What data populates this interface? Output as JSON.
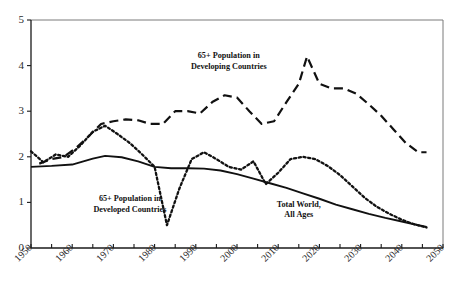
{
  "chart_data": {
    "type": "line",
    "title": "",
    "subtitle": "",
    "xlabel": "",
    "ylabel": "",
    "xlim": [
      1950,
      2050
    ],
    "ylim": [
      0,
      5
    ],
    "grid": false,
    "legend_position": "inline-annotations",
    "y_ticks": [
      "0",
      "1",
      "2",
      "3",
      "4",
      "5"
    ],
    "y_tick_values": [
      0,
      1,
      2,
      3,
      4,
      5
    ],
    "x_ticks": [
      "1950",
      "1960",
      "1970",
      "1980",
      "1990",
      "2000",
      "2010",
      "2020",
      "2030",
      "2040",
      "2050"
    ],
    "x_tick_values": [
      1950,
      1960,
      1970,
      1980,
      1990,
      2000,
      2010,
      2020,
      2030,
      2040,
      2050
    ],
    "x_minor_tick_values": [
      1955,
      1965,
      1975,
      1985,
      1995,
      2005,
      2015,
      2025,
      2035,
      2045
    ],
    "annotations": [
      {
        "name": "developing-countries-label",
        "lines": [
          "65+ Population in",
          "Developing Countries"
        ],
        "x": 1998,
        "y": 4.08
      },
      {
        "name": "developed-countries-label",
        "lines": [
          "65+ Population in",
          "Developed Countries"
        ],
        "x": 1974,
        "y": 0.95
      },
      {
        "name": "total-world-label",
        "lines": [
          "Total World,",
          "All Ages"
        ],
        "x": 2015,
        "y": 0.82
      }
    ],
    "series": [
      {
        "name": "65+ Population in Developing Countries",
        "style": "dashed",
        "color": "#111111",
        "x": [
          1952,
          1955,
          1958,
          1961,
          1964,
          1967,
          1970,
          1973,
          1976,
          1979,
          1982,
          1985,
          1988,
          1991,
          1994,
          1997,
          2000,
          2003,
          2006,
          2009,
          2012,
          2015,
          2017,
          2020,
          2023,
          2026,
          2029,
          2032,
          2035,
          2038,
          2041,
          2044,
          2046
        ],
        "values": [
          1.85,
          1.95,
          2.0,
          2.2,
          2.45,
          2.72,
          2.78,
          2.82,
          2.8,
          2.72,
          2.72,
          3.0,
          3.0,
          2.95,
          3.2,
          3.35,
          3.3,
          3.0,
          2.72,
          2.78,
          3.2,
          3.6,
          4.2,
          3.6,
          3.5,
          3.5,
          3.38,
          3.15,
          2.9,
          2.6,
          2.3,
          2.1,
          2.1
        ]
      },
      {
        "name": "65+ Population in Developed Countries",
        "style": "dotted",
        "color": "#111111",
        "x": [
          1950,
          1953,
          1956,
          1959,
          1962,
          1965,
          1968,
          1971,
          1974,
          1977,
          1980,
          1983,
          1986,
          1989,
          1992,
          1995,
          1998,
          2001,
          2004,
          2007,
          2010,
          2013,
          2016,
          2019,
          2022,
          2025,
          2028,
          2031,
          2034,
          2037,
          2040,
          2043,
          2046
        ],
        "values": [
          2.12,
          1.88,
          2.05,
          2.0,
          2.25,
          2.55,
          2.68,
          2.5,
          2.3,
          2.05,
          1.78,
          0.5,
          1.3,
          1.95,
          2.1,
          1.95,
          1.78,
          1.72,
          1.9,
          1.4,
          1.65,
          1.95,
          2.0,
          1.95,
          1.8,
          1.6,
          1.35,
          1.1,
          0.9,
          0.75,
          0.62,
          0.52,
          0.45
        ]
      },
      {
        "name": "Total World, All Ages",
        "style": "solid",
        "color": "#111111",
        "x": [
          1950,
          1955,
          1960,
          1965,
          1968,
          1972,
          1976,
          1980,
          1984,
          1988,
          1992,
          1996,
          2000,
          2004,
          2008,
          2012,
          2016,
          2020,
          2024,
          2028,
          2032,
          2036,
          2040,
          2043,
          2046
        ],
        "values": [
          1.78,
          1.8,
          1.83,
          1.96,
          2.02,
          1.99,
          1.9,
          1.78,
          1.75,
          1.75,
          1.74,
          1.7,
          1.62,
          1.52,
          1.42,
          1.32,
          1.2,
          1.08,
          0.95,
          0.85,
          0.75,
          0.66,
          0.58,
          0.52,
          0.46
        ]
      }
    ]
  },
  "axes": {
    "frame_color": "#7a7a7a",
    "axis_color": "#1a1a1a"
  }
}
